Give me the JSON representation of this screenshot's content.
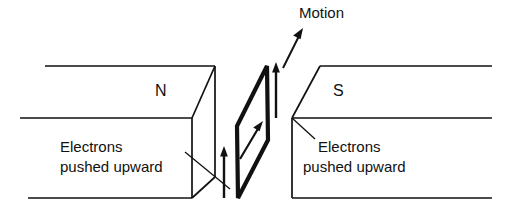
{
  "figure": {
    "labels": {
      "motion": "Motion",
      "north_pole": "N",
      "south_pole": "S",
      "electrons_left_line1": "Electrons",
      "electrons_left_line2": "pushed upward",
      "electrons_right_line1": "Electrons",
      "electrons_right_line2": "pushed upward"
    },
    "colors": {
      "ink": "#111111",
      "background": "#ffffff"
    },
    "icons": {
      "motion_arrow": "arrow-up-right-icon",
      "electron_flow_arrow_left": "arrow-up-icon",
      "electron_flow_arrow_right": "arrow-up-icon",
      "conductor_current_arrow": "arrow-up-right-icon"
    }
  }
}
